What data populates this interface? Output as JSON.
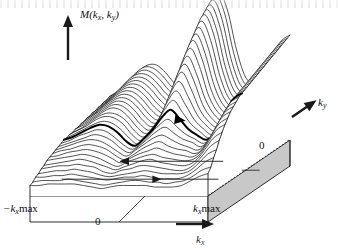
{
  "figure": {
    "plot_style": "waterfall mesh surface over a shaded base slab",
    "background_color": "#ffffff",
    "line_color": "#1a1a1a",
    "base_fill_color": "#d0d0d0",
    "base_side_fill_color": "#ffffff",
    "highlight_color": "#000000"
  },
  "axes": {
    "vertical": {
      "label": "M(k",
      "label_sub1": "x",
      "label_mid": ", k",
      "label_sub2": "y",
      "label_end": ")",
      "full_label": "M(kx, ky)",
      "arrow_direction": "up",
      "arrow_name": "m-axis-arrow"
    },
    "horizontal": {
      "label": "k",
      "label_sub": "x",
      "full_label": "kx",
      "arrow_direction": "right",
      "arrow_name": "kx-axis-arrow",
      "ticks": [
        {
          "text": "−k",
          "sub": "x",
          "suffix": "max",
          "full": "−kx max",
          "position": "left"
        },
        {
          "text": "0",
          "sub": "",
          "suffix": "",
          "full": "0",
          "position": "center"
        },
        {
          "text": "k",
          "sub": "x",
          "suffix": "max",
          "full": "kx max",
          "position": "right"
        }
      ]
    },
    "depth": {
      "label": "k",
      "label_sub": "y",
      "full_label": "ky",
      "arrow_direction": "up-right",
      "arrow_name": "ky-axis-arrow",
      "ticks": [
        {
          "full": "0",
          "position": "right-edge"
        }
      ]
    }
  },
  "annotations": [
    {
      "name": "highlighted-trace-arrow",
      "style": "bold",
      "direction": "right",
      "description": "bold profile curve across the surface with arrowhead"
    },
    {
      "name": "base-arrow-left",
      "style": "thin",
      "direction": "left",
      "description": "arrow on base plane pointing left"
    },
    {
      "name": "base-arrow-right",
      "style": "thin",
      "direction": "right",
      "description": "arrow on base plane pointing right"
    }
  ],
  "chart_data": {
    "type": "line",
    "subtype": "waterfall-surface-3d",
    "title": "M(kx, ky)",
    "xlabel": "kx",
    "ylabel": "ky",
    "zlabel": "M(kx, ky)",
    "xlim": [
      -1,
      1
    ],
    "ylim": [
      0,
      1
    ],
    "zlim": [
      0,
      1
    ],
    "grid": false,
    "legend": false,
    "n_traces": 30,
    "x_tick_labels": [
      "−kx max",
      "0",
      "kx max"
    ],
    "y_tick_labels": [
      "0"
    ],
    "highlighted_trace_index": 17,
    "x": [
      -1.0,
      -0.9,
      -0.8,
      -0.7,
      -0.6,
      -0.5,
      -0.4,
      -0.3,
      -0.2,
      -0.1,
      0.0,
      0.1,
      0.2,
      0.3,
      0.4,
      0.5,
      0.6,
      0.7,
      0.8,
      0.9,
      1.0
    ],
    "series": [
      {
        "name": "ky = 1.00",
        "values": [
          0.3,
          0.34,
          0.4,
          0.46,
          0.5,
          0.5,
          0.45,
          0.38,
          0.34,
          0.4,
          0.62,
          0.88,
          0.99,
          0.86,
          0.6,
          0.42,
          0.38,
          0.44,
          0.56,
          0.66,
          0.7
        ]
      },
      {
        "name": "ky = 0.97",
        "values": [
          0.3,
          0.34,
          0.4,
          0.46,
          0.5,
          0.49,
          0.44,
          0.37,
          0.33,
          0.39,
          0.61,
          0.87,
          0.98,
          0.85,
          0.59,
          0.41,
          0.37,
          0.43,
          0.55,
          0.65,
          0.69
        ]
      },
      {
        "name": "ky = 0.93",
        "values": [
          0.29,
          0.33,
          0.39,
          0.45,
          0.49,
          0.48,
          0.43,
          0.36,
          0.32,
          0.38,
          0.59,
          0.85,
          0.96,
          0.83,
          0.57,
          0.4,
          0.36,
          0.42,
          0.54,
          0.64,
          0.68
        ]
      },
      {
        "name": "ky = 0.90",
        "values": [
          0.29,
          0.33,
          0.39,
          0.45,
          0.48,
          0.47,
          0.42,
          0.35,
          0.31,
          0.37,
          0.57,
          0.83,
          0.94,
          0.81,
          0.56,
          0.39,
          0.35,
          0.41,
          0.53,
          0.63,
          0.67
        ]
      },
      {
        "name": "ky = 0.86",
        "values": [
          0.28,
          0.32,
          0.38,
          0.44,
          0.47,
          0.46,
          0.41,
          0.34,
          0.3,
          0.36,
          0.55,
          0.81,
          0.92,
          0.79,
          0.54,
          0.38,
          0.34,
          0.4,
          0.52,
          0.62,
          0.66
        ]
      },
      {
        "name": "ky = 0.83",
        "values": [
          0.28,
          0.32,
          0.38,
          0.43,
          0.46,
          0.45,
          0.4,
          0.33,
          0.29,
          0.35,
          0.53,
          0.79,
          0.9,
          0.77,
          0.53,
          0.37,
          0.33,
          0.39,
          0.51,
          0.61,
          0.65
        ]
      },
      {
        "name": "ky = 0.79",
        "values": [
          0.27,
          0.31,
          0.37,
          0.42,
          0.45,
          0.44,
          0.39,
          0.32,
          0.28,
          0.34,
          0.51,
          0.76,
          0.87,
          0.74,
          0.51,
          0.36,
          0.32,
          0.38,
          0.5,
          0.6,
          0.64
        ]
      },
      {
        "name": "ky = 0.76",
        "values": [
          0.27,
          0.31,
          0.36,
          0.41,
          0.44,
          0.43,
          0.38,
          0.31,
          0.27,
          0.33,
          0.49,
          0.73,
          0.84,
          0.71,
          0.49,
          0.35,
          0.31,
          0.37,
          0.49,
          0.59,
          0.63
        ]
      },
      {
        "name": "ky = 0.72",
        "values": [
          0.26,
          0.3,
          0.35,
          0.4,
          0.43,
          0.42,
          0.37,
          0.3,
          0.26,
          0.32,
          0.47,
          0.7,
          0.81,
          0.68,
          0.47,
          0.34,
          0.3,
          0.36,
          0.48,
          0.58,
          0.62
        ]
      },
      {
        "name": "ky = 0.69",
        "values": [
          0.26,
          0.3,
          0.35,
          0.39,
          0.42,
          0.41,
          0.36,
          0.29,
          0.25,
          0.31,
          0.45,
          0.67,
          0.78,
          0.65,
          0.45,
          0.33,
          0.29,
          0.35,
          0.47,
          0.57,
          0.61
        ]
      },
      {
        "name": "ky = 0.66",
        "values": [
          0.25,
          0.29,
          0.34,
          0.38,
          0.41,
          0.4,
          0.35,
          0.28,
          0.24,
          0.3,
          0.43,
          0.64,
          0.74,
          0.62,
          0.43,
          0.32,
          0.28,
          0.34,
          0.46,
          0.56,
          0.6
        ]
      },
      {
        "name": "ky = 0.62",
        "values": [
          0.25,
          0.29,
          0.33,
          0.37,
          0.4,
          0.39,
          0.34,
          0.27,
          0.23,
          0.29,
          0.41,
          0.6,
          0.7,
          0.58,
          0.41,
          0.31,
          0.27,
          0.33,
          0.45,
          0.55,
          0.59
        ]
      },
      {
        "name": "ky = 0.59",
        "values": [
          0.24,
          0.28,
          0.32,
          0.36,
          0.39,
          0.38,
          0.33,
          0.26,
          0.22,
          0.28,
          0.39,
          0.57,
          0.66,
          0.55,
          0.39,
          0.3,
          0.26,
          0.32,
          0.44,
          0.54,
          0.58
        ]
      },
      {
        "name": "ky = 0.55",
        "values": [
          0.24,
          0.27,
          0.31,
          0.35,
          0.38,
          0.37,
          0.32,
          0.25,
          0.21,
          0.27,
          0.37,
          0.53,
          0.62,
          0.51,
          0.37,
          0.29,
          0.25,
          0.31,
          0.43,
          0.53,
          0.57
        ]
      },
      {
        "name": "ky = 0.52",
        "values": [
          0.23,
          0.26,
          0.3,
          0.34,
          0.36,
          0.35,
          0.31,
          0.24,
          0.2,
          0.26,
          0.35,
          0.49,
          0.57,
          0.47,
          0.35,
          0.28,
          0.24,
          0.3,
          0.42,
          0.52,
          0.56
        ]
      },
      {
        "name": "ky = 0.48",
        "values": [
          0.23,
          0.26,
          0.29,
          0.33,
          0.35,
          0.34,
          0.3,
          0.23,
          0.19,
          0.25,
          0.33,
          0.45,
          0.52,
          0.43,
          0.33,
          0.27,
          0.23,
          0.29,
          0.41,
          0.51,
          0.55
        ]
      },
      {
        "name": "ky = 0.45",
        "values": [
          0.22,
          0.25,
          0.28,
          0.31,
          0.33,
          0.32,
          0.28,
          0.22,
          0.18,
          0.24,
          0.31,
          0.41,
          0.47,
          0.39,
          0.31,
          0.26,
          0.22,
          0.28,
          0.4,
          0.5,
          0.54
        ]
      },
      {
        "name": "ky = 0.41",
        "values": [
          0.22,
          0.24,
          0.27,
          0.3,
          0.32,
          0.31,
          0.27,
          0.21,
          0.18,
          0.23,
          0.29,
          0.37,
          0.42,
          0.36,
          0.29,
          0.25,
          0.22,
          0.27,
          0.39,
          0.49,
          0.53
        ]
      },
      {
        "name": "ky = 0.38",
        "values": [
          0.21,
          0.23,
          0.26,
          0.28,
          0.3,
          0.29,
          0.25,
          0.2,
          0.17,
          0.21,
          0.27,
          0.33,
          0.37,
          0.32,
          0.27,
          0.24,
          0.21,
          0.26,
          0.38,
          0.48,
          0.52
        ]
      },
      {
        "name": "ky = 0.34",
        "values": [
          0.2,
          0.22,
          0.24,
          0.26,
          0.28,
          0.27,
          0.24,
          0.19,
          0.16,
          0.2,
          0.25,
          0.3,
          0.33,
          0.29,
          0.25,
          0.23,
          0.2,
          0.25,
          0.36,
          0.46,
          0.5
        ]
      },
      {
        "name": "ky = 0.31",
        "values": [
          0.19,
          0.21,
          0.23,
          0.25,
          0.26,
          0.25,
          0.22,
          0.18,
          0.15,
          0.19,
          0.23,
          0.27,
          0.29,
          0.26,
          0.23,
          0.21,
          0.19,
          0.24,
          0.34,
          0.44,
          0.48
        ]
      },
      {
        "name": "ky = 0.28",
        "values": [
          0.18,
          0.2,
          0.21,
          0.23,
          0.24,
          0.23,
          0.21,
          0.17,
          0.14,
          0.17,
          0.21,
          0.24,
          0.26,
          0.23,
          0.21,
          0.2,
          0.18,
          0.22,
          0.32,
          0.42,
          0.46
        ]
      },
      {
        "name": "ky = 0.24",
        "values": [
          0.17,
          0.18,
          0.2,
          0.21,
          0.22,
          0.21,
          0.19,
          0.16,
          0.13,
          0.16,
          0.19,
          0.21,
          0.23,
          0.21,
          0.19,
          0.18,
          0.17,
          0.21,
          0.3,
          0.39,
          0.43
        ]
      },
      {
        "name": "ky = 0.21",
        "values": [
          0.16,
          0.17,
          0.18,
          0.19,
          0.2,
          0.19,
          0.17,
          0.14,
          0.12,
          0.15,
          0.17,
          0.19,
          0.2,
          0.18,
          0.17,
          0.16,
          0.16,
          0.19,
          0.27,
          0.36,
          0.4
        ]
      },
      {
        "name": "ky = 0.17",
        "values": [
          0.14,
          0.15,
          0.16,
          0.17,
          0.18,
          0.17,
          0.15,
          0.13,
          0.11,
          0.13,
          0.15,
          0.17,
          0.18,
          0.16,
          0.15,
          0.14,
          0.14,
          0.17,
          0.24,
          0.32,
          0.36
        ]
      },
      {
        "name": "ky = 0.14",
        "values": [
          0.13,
          0.14,
          0.15,
          0.15,
          0.16,
          0.15,
          0.14,
          0.11,
          0.1,
          0.12,
          0.13,
          0.15,
          0.15,
          0.14,
          0.13,
          0.12,
          0.12,
          0.15,
          0.21,
          0.28,
          0.32
        ]
      },
      {
        "name": "ky = 0.10",
        "values": [
          0.11,
          0.12,
          0.13,
          0.13,
          0.14,
          0.13,
          0.12,
          0.1,
          0.09,
          0.1,
          0.11,
          0.12,
          0.13,
          0.12,
          0.11,
          0.11,
          0.11,
          0.13,
          0.18,
          0.24,
          0.27
        ]
      },
      {
        "name": "ky = 0.07",
        "values": [
          0.1,
          0.1,
          0.11,
          0.11,
          0.12,
          0.11,
          0.1,
          0.09,
          0.08,
          0.09,
          0.1,
          0.1,
          0.11,
          0.1,
          0.09,
          0.09,
          0.09,
          0.11,
          0.15,
          0.2,
          0.23
        ]
      },
      {
        "name": "ky = 0.03",
        "values": [
          0.08,
          0.09,
          0.09,
          0.09,
          0.1,
          0.09,
          0.08,
          0.07,
          0.06,
          0.07,
          0.08,
          0.09,
          0.09,
          0.08,
          0.08,
          0.07,
          0.08,
          0.09,
          0.12,
          0.16,
          0.18
        ]
      },
      {
        "name": "ky = 0.00",
        "values": [
          0.07,
          0.07,
          0.08,
          0.08,
          0.08,
          0.08,
          0.07,
          0.06,
          0.05,
          0.06,
          0.07,
          0.07,
          0.07,
          0.07,
          0.06,
          0.06,
          0.06,
          0.07,
          0.1,
          0.13,
          0.15
        ]
      }
    ]
  }
}
